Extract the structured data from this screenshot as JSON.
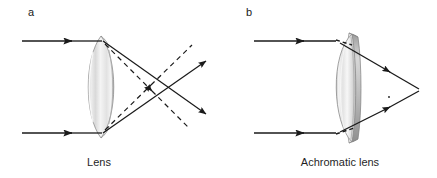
{
  "figure": {
    "background_color": "#ffffff",
    "ink_color": "#1a1a1a",
    "width": 437,
    "height": 178,
    "panels": [
      {
        "letter": "a",
        "letter_x": 28,
        "letter_y": 16,
        "caption": "Lens",
        "caption_x": 99,
        "caption_y": 166,
        "optic_name": "simple-biconvex-lens",
        "glass_fill_light": "#f2f2f2",
        "glass_fill_mid": "#e0e0e0",
        "glass_fill_dark": "#c6c6c6",
        "description": "Chromatic aberration: two incoming parallel rays refract through a single biconvex lens and focus at two different points, solid rays crossing at a nearer focus and dashed rays crossing at a farther focus.",
        "incoming_rays": [
          {
            "name": "upper-incoming-ray",
            "x1": 22,
            "y1": 41,
            "x2": 101,
            "y2": 41,
            "style": "solid",
            "arrow_at": 0.62
          },
          {
            "name": "lower-incoming-ray",
            "x1": 22,
            "y1": 133,
            "x2": 101,
            "y2": 133,
            "style": "solid",
            "arrow_at": 0.62
          }
        ],
        "refracted_rays": [
          {
            "name": "upper-solid-refracted-ray",
            "x1": 103,
            "y1": 41,
            "x2": 205,
            "y2": 113,
            "style": "solid",
            "arrow_at": 1.0
          },
          {
            "name": "lower-solid-refracted-ray",
            "x1": 103,
            "y1": 133,
            "x2": 205,
            "y2": 62,
            "style": "solid",
            "arrow_at": 1.0
          },
          {
            "name": "upper-dashed-refracted-ray",
            "x1": 104,
            "y1": 44,
            "x2": 186,
            "y2": 126,
            "style": "dashed",
            "arrow_at": 0.45
          },
          {
            "name": "lower-dashed-refracted-ray",
            "x1": 104,
            "y1": 130,
            "x2": 190,
            "y2": 49,
            "style": "dashed",
            "arrow_at": 0.45
          }
        ],
        "focus_points": [
          {
            "name": "solid-ray-focus",
            "x": 171,
            "y": 87
          },
          {
            "name": "dashed-ray-focus",
            "x": 147,
            "y": 87
          }
        ]
      },
      {
        "letter": "b",
        "letter_x": 246,
        "letter_y": 16,
        "caption": "Achromatic lens",
        "caption_x": 340,
        "caption_y": 166,
        "optic_name": "achromatic-doublet-lens",
        "glass_fill_light": "#f5f5f5",
        "glass_fill_mid": "#dedede",
        "glass_fill_dark": "#b8b8b8",
        "description": "Achromatic doublet: two incoming parallel rays refract through a cemented doublet and converge to one common focal point.",
        "incoming_rays": [
          {
            "name": "upper-incoming-ray",
            "x1": 254,
            "y1": 41,
            "x2": 334,
            "y2": 41,
            "style": "solid",
            "arrow_at": 0.62
          },
          {
            "name": "lower-incoming-ray",
            "x1": 254,
            "y1": 133,
            "x2": 334,
            "y2": 133,
            "style": "solid",
            "arrow_at": 0.62
          }
        ],
        "refracted_rays": [
          {
            "name": "upper-refracted-ray",
            "x1": 338,
            "y1": 43,
            "x2": 418,
            "y2": 90,
            "style": "solid",
            "arrow_at": 0.55
          },
          {
            "name": "lower-refracted-ray",
            "x1": 338,
            "y1": 131,
            "x2": 418,
            "y2": 90,
            "style": "solid",
            "arrow_at": 0.55
          },
          {
            "name": "upper-internal-ray",
            "x1": 336,
            "y1": 41,
            "x2": 347,
            "y2": 45,
            "style": "dashed",
            "arrow_at": 0.0
          },
          {
            "name": "lower-internal-ray",
            "x1": 336,
            "y1": 133,
            "x2": 350,
            "y2": 128,
            "style": "dashed",
            "arrow_at": 0.0
          }
        ],
        "focus_points": [
          {
            "name": "common-focal-point",
            "x": 418,
            "y": 90
          }
        ]
      }
    ]
  }
}
